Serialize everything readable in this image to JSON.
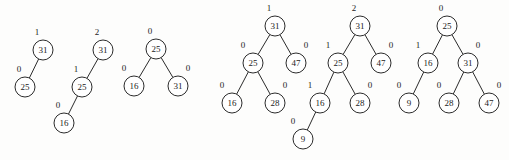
{
  "figure": {
    "type": "diagram",
    "subtype": "avl-binary-search-trees",
    "width": 509,
    "height": 160,
    "background_color": "#fdfdfc",
    "stroke_color": "#2b2b2b",
    "text_color": "#1c1c1c",
    "node_radius": 10,
    "trees": [
      {
        "name": "tree-1",
        "nodes": [
          {
            "id": "t1-31",
            "key": "31",
            "balance": "1",
            "cx": 43,
            "cy": 50,
            "balance_x": 37,
            "balance_y": 33
          },
          {
            "id": "t1-25",
            "key": "25",
            "balance": "0",
            "cx": 25,
            "cy": 87,
            "balance_x": 19,
            "balance_y": 70
          }
        ],
        "edges": [
          {
            "from": "t1-31",
            "to": "t1-25"
          }
        ]
      },
      {
        "name": "tree-2",
        "nodes": [
          {
            "id": "t2-31",
            "key": "31",
            "balance": "2",
            "cx": 103,
            "cy": 50,
            "balance_x": 97,
            "balance_y": 33
          },
          {
            "id": "t2-25",
            "key": "25",
            "balance": "1",
            "cx": 82,
            "cy": 87,
            "balance_x": 76,
            "balance_y": 70
          },
          {
            "id": "t2-16",
            "key": "16",
            "balance": "0",
            "cx": 64,
            "cy": 123,
            "balance_x": 58,
            "balance_y": 106
          }
        ],
        "edges": [
          {
            "from": "t2-31",
            "to": "t2-25"
          },
          {
            "from": "t2-25",
            "to": "t2-16"
          }
        ]
      },
      {
        "name": "tree-3",
        "nodes": [
          {
            "id": "t3-25",
            "key": "25",
            "balance": "0",
            "cx": 156,
            "cy": 49,
            "balance_x": 150,
            "balance_y": 32
          },
          {
            "id": "t3-16",
            "key": "16",
            "balance": "0",
            "cx": 134,
            "cy": 86,
            "balance_x": 124,
            "balance_y": 69
          },
          {
            "id": "t3-31",
            "key": "31",
            "balance": "0",
            "cx": 178,
            "cy": 86,
            "balance_x": 188,
            "balance_y": 69
          }
        ],
        "edges": [
          {
            "from": "t3-25",
            "to": "t3-16"
          },
          {
            "from": "t3-25",
            "to": "t3-31"
          }
        ]
      },
      {
        "name": "tree-4",
        "nodes": [
          {
            "id": "t4-31",
            "key": "31",
            "balance": "1",
            "cx": 275,
            "cy": 26,
            "balance_x": 269,
            "balance_y": 9
          },
          {
            "id": "t4-25",
            "key": "25",
            "balance": "0",
            "cx": 253,
            "cy": 63,
            "balance_x": 243,
            "balance_y": 46
          },
          {
            "id": "t4-47",
            "key": "47",
            "balance": "0",
            "cx": 296,
            "cy": 63,
            "balance_x": 306,
            "balance_y": 46
          },
          {
            "id": "t4-16",
            "key": "16",
            "balance": "0",
            "cx": 232,
            "cy": 103,
            "balance_x": 222,
            "balance_y": 86
          },
          {
            "id": "t4-28",
            "key": "28",
            "balance": "0",
            "cx": 275,
            "cy": 103,
            "balance_x": 285,
            "balance_y": 86
          }
        ],
        "edges": [
          {
            "from": "t4-31",
            "to": "t4-25"
          },
          {
            "from": "t4-31",
            "to": "t4-47"
          },
          {
            "from": "t4-25",
            "to": "t4-16"
          },
          {
            "from": "t4-25",
            "to": "t4-28"
          }
        ]
      },
      {
        "name": "tree-5",
        "nodes": [
          {
            "id": "t5-31",
            "key": "31",
            "balance": "2",
            "cx": 360,
            "cy": 26,
            "balance_x": 354,
            "balance_y": 9
          },
          {
            "id": "t5-25",
            "key": "25",
            "balance": "1",
            "cx": 338,
            "cy": 63,
            "balance_x": 328,
            "balance_y": 46
          },
          {
            "id": "t5-47",
            "key": "47",
            "balance": "0",
            "cx": 381,
            "cy": 63,
            "balance_x": 391,
            "balance_y": 46
          },
          {
            "id": "t5-16",
            "key": "16",
            "balance": "1",
            "cx": 320,
            "cy": 103,
            "balance_x": 310,
            "balance_y": 86
          },
          {
            "id": "t5-28",
            "key": "28",
            "balance": "0",
            "cx": 360,
            "cy": 103,
            "balance_x": 370,
            "balance_y": 86
          },
          {
            "id": "t5-9",
            "key": "9",
            "balance": "0",
            "cx": 303,
            "cy": 139,
            "balance_x": 293,
            "balance_y": 122
          }
        ],
        "edges": [
          {
            "from": "t5-31",
            "to": "t5-25"
          },
          {
            "from": "t5-31",
            "to": "t5-47"
          },
          {
            "from": "t5-25",
            "to": "t5-16"
          },
          {
            "from": "t5-25",
            "to": "t5-28"
          },
          {
            "from": "t5-16",
            "to": "t5-9"
          }
        ]
      },
      {
        "name": "tree-6",
        "nodes": [
          {
            "id": "t6-25",
            "key": "25",
            "balance": "0",
            "cx": 447,
            "cy": 26,
            "balance_x": 441,
            "balance_y": 9
          },
          {
            "id": "t6-16",
            "key": "16",
            "balance": "1",
            "cx": 428,
            "cy": 63,
            "balance_x": 418,
            "balance_y": 46
          },
          {
            "id": "t6-31",
            "key": "31",
            "balance": "0",
            "cx": 468,
            "cy": 63,
            "balance_x": 478,
            "balance_y": 46
          },
          {
            "id": "t6-9",
            "key": "9",
            "balance": "0",
            "cx": 409,
            "cy": 103,
            "balance_x": 399,
            "balance_y": 86
          },
          {
            "id": "t6-28",
            "key": "28",
            "balance": "0",
            "cx": 449,
            "cy": 103,
            "balance_x": 439,
            "balance_y": 86
          },
          {
            "id": "t6-47",
            "key": "47",
            "balance": "0",
            "cx": 489,
            "cy": 103,
            "balance_x": 499,
            "balance_y": 86
          }
        ],
        "edges": [
          {
            "from": "t6-25",
            "to": "t6-16"
          },
          {
            "from": "t6-25",
            "to": "t6-31"
          },
          {
            "from": "t6-16",
            "to": "t6-9"
          },
          {
            "from": "t6-31",
            "to": "t6-28"
          },
          {
            "from": "t6-31",
            "to": "t6-47"
          }
        ]
      }
    ]
  }
}
